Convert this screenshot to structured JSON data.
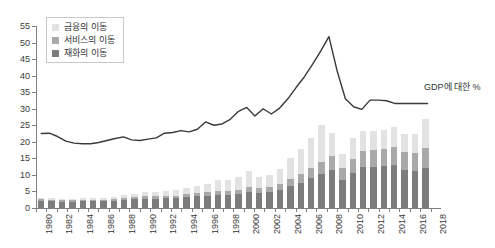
{
  "chart_data": {
    "type": "bar",
    "title": "",
    "subtitle": "",
    "xlabel": "",
    "ylabel": "",
    "ylim": [
      0,
      55
    ],
    "ytick_step": 5,
    "yticks": [
      0,
      5,
      10,
      15,
      20,
      25,
      30,
      35,
      40,
      45,
      50,
      55
    ],
    "grid": false,
    "legend_position": "top-left",
    "annotation": "GDP에 대한 %",
    "x": [
      1980,
      1981,
      1982,
      1983,
      1984,
      1985,
      1986,
      1987,
      1988,
      1989,
      1990,
      1991,
      1992,
      1993,
      1994,
      1995,
      1996,
      1997,
      1998,
      1999,
      2000,
      2001,
      2002,
      2003,
      2004,
      2005,
      2006,
      2007,
      2008,
      2009,
      2010,
      2011,
      2012,
      2013,
      2014,
      2015,
      2016,
      2017,
      2018
    ],
    "xtick_labels": [
      "1980",
      "1982",
      "1984",
      "1986",
      "1988",
      "1990",
      "1992",
      "1994",
      "1996",
      "1998",
      "2000",
      "2002",
      "2004",
      "2006",
      "2008",
      "2010",
      "2012",
      "2014",
      "2016",
      "2018"
    ],
    "bar_stack_order": [
      "goods",
      "services",
      "finance"
    ],
    "series": [
      {
        "name": "재화의 이동",
        "key": "goods",
        "color": "#7c7c7c",
        "values": [
          2.1,
          2.0,
          1.9,
          1.9,
          2.0,
          2.0,
          2.0,
          2.2,
          2.4,
          2.6,
          2.8,
          2.8,
          2.9,
          2.9,
          3.2,
          3.6,
          3.7,
          4.0,
          4.0,
          4.2,
          4.8,
          4.6,
          4.8,
          5.4,
          6.6,
          7.7,
          9.0,
          10.2,
          11.6,
          8.6,
          10.6,
          12.5,
          12.5,
          12.6,
          13.0,
          11.6,
          11.2,
          12.1,
          null
        ]
      },
      {
        "name": "서비스의 이동",
        "key": "services",
        "color": "#a9a9a9",
        "values": [
          0.5,
          0.5,
          0.5,
          0.5,
          0.5,
          0.5,
          0.5,
          0.6,
          0.6,
          0.7,
          0.8,
          0.8,
          0.8,
          0.8,
          0.9,
          1.0,
          1.1,
          1.2,
          1.2,
          1.3,
          1.5,
          1.5,
          1.6,
          1.8,
          2.2,
          2.6,
          3.1,
          3.6,
          4.1,
          3.4,
          4.2,
          4.8,
          4.9,
          5.2,
          5.5,
          5.3,
          5.4,
          5.9,
          null
        ]
      },
      {
        "name": "금융의 이동",
        "key": "finance",
        "color": "#e2e2e2",
        "values": [
          0.4,
          0.4,
          0.4,
          0.4,
          0.4,
          0.4,
          0.5,
          0.6,
          0.8,
          1.0,
          1.2,
          1.2,
          1.4,
          1.8,
          1.9,
          2.2,
          2.6,
          3.4,
          3.2,
          4.0,
          5.0,
          3.2,
          3.6,
          4.6,
          6.2,
          7.5,
          9.2,
          11.4,
          7.0,
          4.2,
          6.4,
          6.0,
          5.8,
          5.8,
          6.0,
          5.6,
          5.8,
          9.0,
          null
        ]
      }
    ],
    "line_series": {
      "name": "GDP에 대한 %",
      "color": "#3a3a3a",
      "values": [
        22.5,
        22.6,
        21.6,
        20.2,
        19.6,
        19.4,
        19.4,
        19.8,
        20.4,
        21.0,
        21.5,
        20.6,
        20.4,
        20.8,
        21.2,
        22.6,
        22.8,
        23.4,
        23.0,
        23.8,
        26.0,
        25.0,
        25.4,
        26.8,
        29.2,
        30.4,
        27.8,
        30.0,
        28.4,
        30.2,
        33.0,
        36.4,
        39.6,
        43.4,
        47.4,
        51.8,
        41.4,
        33.0,
        30.6,
        29.8,
        32.6,
        32.6,
        32.4,
        31.6,
        31.6,
        31.6,
        31.6,
        31.6,
        null
      ]
    }
  },
  "legend": {
    "items": [
      {
        "label": "금융의 이동",
        "color": "#e2e2e2",
        "swatch_name": "legend-swatch-finance"
      },
      {
        "label": "서비스의 이동",
        "color": "#a9a9a9",
        "swatch_name": "legend-swatch-services"
      },
      {
        "label": "재화의 이동",
        "color": "#7c7c7c",
        "swatch_name": "legend-swatch-goods"
      }
    ]
  },
  "annotation": {
    "text": "GDP에 대한 %"
  }
}
